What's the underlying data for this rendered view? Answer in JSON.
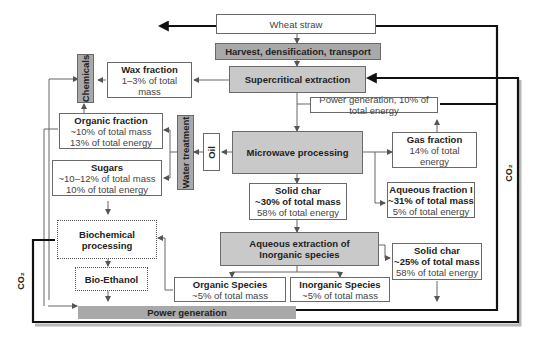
{
  "diagram": {
    "nodes": {
      "wheat_straw": {
        "label": "Wheat straw"
      },
      "harvest": {
        "label": "Harvest, densification, transport"
      },
      "supercritical": {
        "label": "Supercritical extraction"
      },
      "wax": {
        "title": "Wax fraction",
        "line1": "1–3% of total",
        "line2": "mass"
      },
      "chemicals": {
        "label": "Chemicals"
      },
      "power_gen_top": {
        "label": "Power generation, 10% of total energy"
      },
      "organic_fraction": {
        "title": "Organic fraction",
        "line1": "~10% of total mass",
        "line2": "13% of total energy"
      },
      "water_treatment": {
        "label": "Water treatment"
      },
      "oil": {
        "label": "Oil"
      },
      "microwave": {
        "label": "Microwave processing"
      },
      "gas_fraction": {
        "title": "Gas fraction",
        "line1": "14% of total",
        "line2": "energy"
      },
      "sugars": {
        "title": "Sugars",
        "line1": "~10–12% of total mass",
        "line2": "10% of total energy"
      },
      "solid_char_1": {
        "title": "Solid char",
        "line1": "~30% of total mass",
        "line2": "58% of total energy"
      },
      "aqueous_fraction": {
        "title": "Aqueous fraction I",
        "line1": "~31% of total mass",
        "line2": "5% of total energy"
      },
      "biochemical": {
        "line1": "Biochemical",
        "line2": "processing"
      },
      "aqueous_extraction": {
        "line1": "Aqueous extraction of",
        "line2": "Inorganic species"
      },
      "solid_char_2": {
        "title": "Solid char",
        "line1": "~25% of total mass",
        "line2": "58% of total energy"
      },
      "bio_ethanol": {
        "label": "Bio-Ethanol"
      },
      "organic_species": {
        "title": "Organic Species",
        "line1": "~5% of total mass"
      },
      "inorganic_species": {
        "title": "Inorganic Species",
        "line1": "~5% of total mass"
      },
      "power_gen_bottom": {
        "label": "Power generation"
      }
    },
    "labels": {
      "co2_left": "CO₂",
      "co2_right": "CO₂"
    }
  }
}
